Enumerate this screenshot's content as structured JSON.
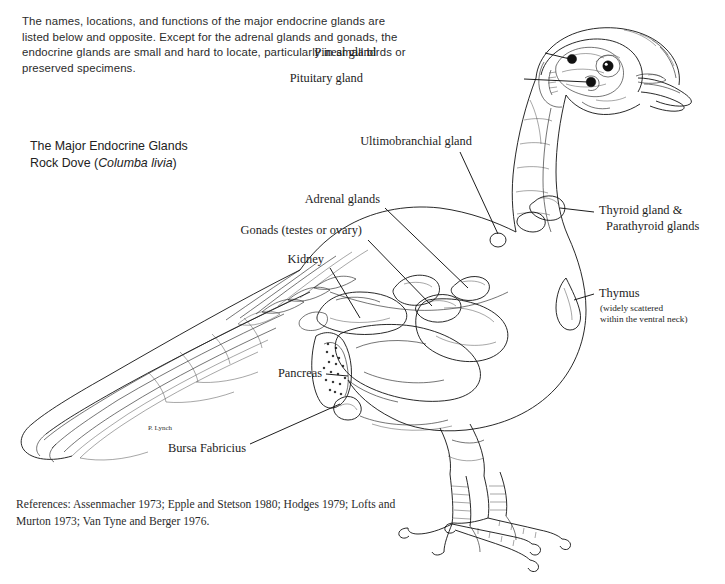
{
  "document": {
    "intro_paragraph": "The names, locations, and functions of the major endocrine glands are listed below and opposite. Except for the adrenal glands and gonads, the endocrine glands are small and hard to locate, particularly in small birds or preserved specimens.",
    "title": "The Major Endocrine Glands",
    "subtitle_common_name": "Rock Dove (",
    "subtitle_species": "Columba livia",
    "subtitle_close": ")",
    "references": "References: Assenmacher 1973; Epple and Stetson 1980; Hodges 1979; Lofts and Murton 1973; Van Tyne and Berger 1976.",
    "artist_signature": "P. Lynch"
  },
  "labels": {
    "pineal_gland": "Pineal gland",
    "pituitary_gland": "Pituitary gland",
    "ultimobranchial_gland": "Ultimobranchial gland",
    "adrenal_glands": "Adrenal glands",
    "gonads": "Gonads (testes or ovary)",
    "kidney": "Kidney",
    "pancreas": "Pancreas",
    "bursa_fabricius": "Bursa Fabricius",
    "thyroid_line1": "Thyroid gland &",
    "thyroid_line2": "Parathyroid glands",
    "thymus": "Thymus",
    "thymus_note_line1": "(widely scattered",
    "thymus_note_line2": "within the ventral neck)"
  },
  "colors": {
    "background": "#ffffff",
    "ink": "#111111",
    "text": "#1d1d1d"
  }
}
